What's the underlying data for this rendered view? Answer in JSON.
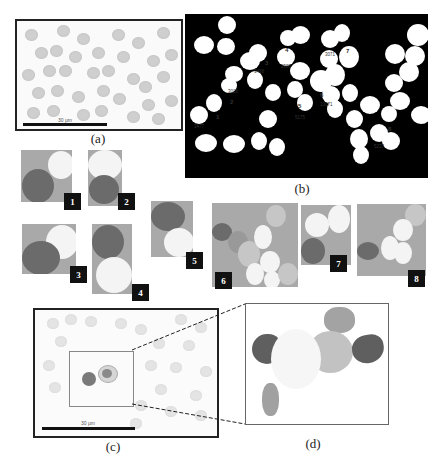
{
  "figure": {
    "panels": {
      "a": {
        "caption": "(a)",
        "description": "Blood smear micrograph with red blood cells",
        "scale_bar": "30 µm"
      },
      "b": {
        "caption": "(b)",
        "description": "Binary segmentation mask with labeled overlapping cell clusters",
        "regions": [
          {
            "id": "1",
            "area": "3477"
          },
          {
            "id": "2",
            "area": "3016"
          },
          {
            "id": "3",
            "area": "3498"
          },
          {
            "id": "4",
            "area": "2907"
          },
          {
            "id": "5",
            "area": "5175"
          },
          {
            "id": "6",
            "area": "10071"
          },
          {
            "id": "7",
            "area": "3071"
          },
          {
            "id": "8",
            "area": "5237"
          }
        ]
      },
      "thumbnails": [
        {
          "label": "1"
        },
        {
          "label": "2"
        },
        {
          "label": "3"
        },
        {
          "label": "4"
        },
        {
          "label": "5"
        },
        {
          "label": "6"
        },
        {
          "label": "7"
        },
        {
          "label": "8"
        }
      ],
      "c": {
        "caption": "(c)",
        "description": "Blood smear with highlighted region containing cells",
        "scale_bar": "30 µm"
      },
      "d": {
        "caption": "(d)",
        "description": "Segmented cells from highlighted region"
      }
    }
  }
}
